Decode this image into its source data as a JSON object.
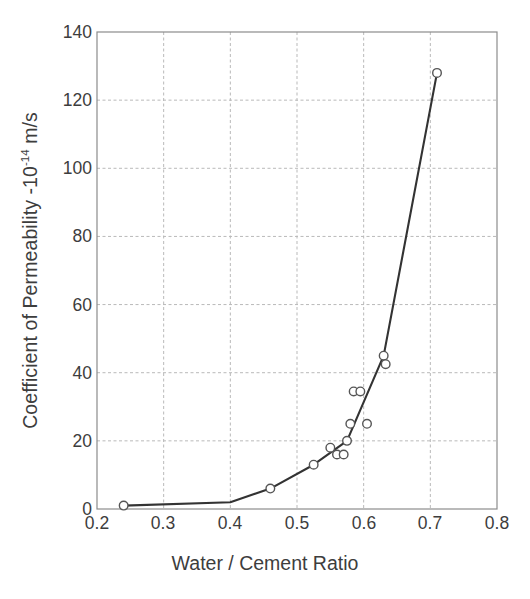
{
  "chart_data": {
    "type": "line",
    "title": "",
    "subtitle": "",
    "xlabel": "Water / Cement Ratio",
    "ylabel_text": "Coefficient of Permeability -10",
    "ylabel_exponent": "-14",
    "ylabel_units": " m/s",
    "ylabel_full": "Coefficient of Permeability -10-14 m/s",
    "xlim": [
      0.2,
      0.8
    ],
    "ylim": [
      0,
      140
    ],
    "xticks": [
      "0.2",
      "0.3",
      "0.4",
      "0.5",
      "0.6",
      "0.7",
      "0.8"
    ],
    "xtick_values": [
      0.2,
      0.3,
      0.4,
      0.5,
      0.6,
      0.7,
      0.8
    ],
    "yticks": [
      "0",
      "20",
      "40",
      "60",
      "80",
      "100",
      "120",
      "140"
    ],
    "ytick_values": [
      0,
      20,
      40,
      60,
      80,
      100,
      120,
      140
    ],
    "grid": true,
    "grid_style": "dashed",
    "legend": "none",
    "marker": "open-circle",
    "series": [
      {
        "name": "Coefficient of Permeability",
        "x": [
          0.24,
          0.46,
          0.525,
          0.55,
          0.56,
          0.57,
          0.575,
          0.58,
          0.585,
          0.595,
          0.605,
          0.63,
          0.633,
          0.71
        ],
        "y": [
          1,
          6,
          13,
          18,
          16,
          16,
          20,
          25,
          34.5,
          34.5,
          25,
          45,
          42.5,
          128
        ]
      }
    ],
    "fit_curve": {
      "name": "trend-line",
      "x": [
        0.24,
        0.4,
        0.46,
        0.525,
        0.575,
        0.63,
        0.71
      ],
      "y": [
        1,
        2,
        6,
        13,
        20,
        45,
        128
      ]
    },
    "colors": {
      "line": "#333333",
      "marker_stroke": "#555555",
      "marker_fill": "#ffffff",
      "grid": "#b9b9b9",
      "frame": "#8c8c8c",
      "text": "#3d3d3d",
      "background": "#ffffff"
    }
  }
}
